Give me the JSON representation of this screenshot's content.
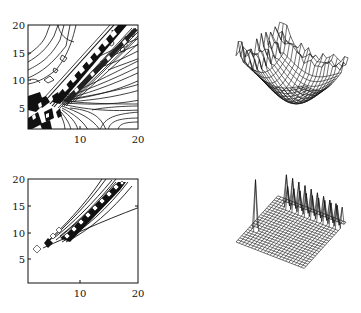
{
  "chart_data": [
    {
      "type": "contour",
      "panel": "top-left",
      "title": "",
      "xlabel": "",
      "ylabel": "",
      "xlim": [
        1,
        20
      ],
      "ylim": [
        1,
        20
      ],
      "xticks": [
        "10",
        "20"
      ],
      "yticks": [
        "5",
        "10",
        "15",
        "20"
      ],
      "description": "Dense contour map with diagonal band of closed contours along y≈x+3; radial fan of contours from (7,7) toward lower-right; noisy region in lower-left corner"
    },
    {
      "type": "surface",
      "panel": "top-right",
      "title": "",
      "description": "3D wireframe mesh of a bowl-shaped surface with jagged ridge along back edge and spiky left edge"
    },
    {
      "type": "contour",
      "panel": "bottom-left",
      "title": "",
      "xlabel": "",
      "ylabel": "",
      "xlim": [
        1,
        20
      ],
      "ylim": [
        1,
        20
      ],
      "xticks": [
        "10",
        "20"
      ],
      "yticks": [
        "5",
        "10",
        "15",
        "20"
      ],
      "description": "Few contours forming a narrow diagonal wedge from (4,7) to (18,20) with a chain of diamond-shaped closed contours along its center; isolated diamond near (2,7)"
    },
    {
      "type": "surface",
      "panel": "bottom-right",
      "title": "",
      "description": "3D wireframe of a flat plane with a single tall spike near the left corner and a row of regularly spaced spikes along the back diagonal"
    }
  ],
  "panels": {
    "top_left": {
      "yticks": [
        {
          "label": "20",
          "y": 25
        },
        {
          "label": "15",
          "y": 53
        },
        {
          "label": "10",
          "y": 80
        },
        {
          "label": "5",
          "y": 108
        }
      ],
      "xticks": [
        {
          "label": "10",
          "x": 80
        },
        {
          "label": "20",
          "x": 138
        }
      ]
    },
    "bottom_left": {
      "yticks": [
        {
          "label": "20",
          "y": 179
        },
        {
          "label": "15",
          "y": 206
        },
        {
          "label": "10",
          "y": 233
        },
        {
          "label": "5",
          "y": 259
        }
      ],
      "xticks": [
        {
          "label": "10",
          "x": 80
        },
        {
          "label": "20",
          "x": 138
        }
      ]
    }
  }
}
